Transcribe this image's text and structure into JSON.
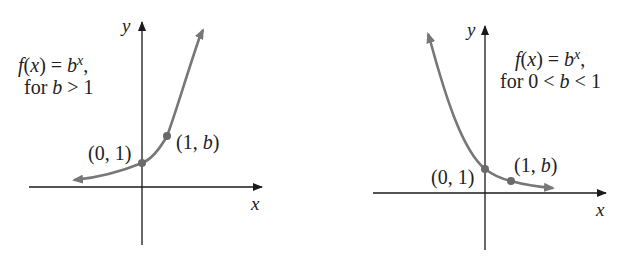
{
  "colors": {
    "axis": "#1a1a1a",
    "curve": "#777777",
    "point": "#6a6a6a",
    "text": "#222222"
  },
  "graph_left": {
    "title_line1": "f(x) = bˣ,",
    "title_f": "f",
    "title_paren_open": "(",
    "title_x": "x",
    "title_eq": ") = ",
    "title_b": "b",
    "title_sup": "x",
    "title_comma": ",",
    "title_line2_prefix": "for ",
    "title_line2_b": "b",
    "title_line2_suffix": " > 1",
    "y_axis_label": "y",
    "x_axis_label": "x",
    "point1_label": "(0, 1)",
    "point2_label_open": "(1, ",
    "point2_label_b": "b",
    "point2_label_close": ")"
  },
  "graph_right": {
    "title_f": "f",
    "title_paren_open": "(",
    "title_x": "x",
    "title_eq": ") = ",
    "title_b": "b",
    "title_sup": "x",
    "title_comma": ",",
    "title_line2_prefix": "for 0 < ",
    "title_line2_b": "b",
    "title_line2_suffix": " < 1",
    "y_axis_label": "y",
    "x_axis_label": "x",
    "point1_label": "(0, 1)",
    "point2_label_open": "(1, ",
    "point2_label_b": "b",
    "point2_label_close": ")"
  }
}
